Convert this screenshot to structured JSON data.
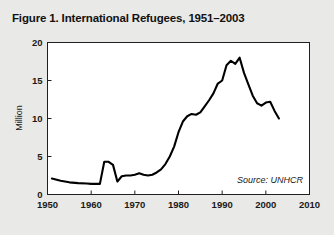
{
  "figure": {
    "title": "Figure 1. International Refugees, 1951–2003",
    "source_note": "Source: UNHCR",
    "background_color": "#e9e9e7",
    "plot_background_color": "#ffffff",
    "line_color": "#000000",
    "frame_color": "#231f20"
  },
  "chart_data": {
    "type": "line",
    "title": "Figure 1. International Refugees, 1951–2003",
    "xlabel": "",
    "ylabel": "Million",
    "xlim": [
      1950,
      2010
    ],
    "ylim": [
      0,
      20
    ],
    "xticks": [
      1950,
      1960,
      1970,
      1980,
      1990,
      2000,
      2010
    ],
    "yticks": [
      0,
      5,
      10,
      15,
      20
    ],
    "xtick_labels": [
      "1950",
      "1960",
      "1970",
      "1980",
      "1990",
      "2000",
      "2010"
    ],
    "ytick_labels": [
      "0",
      "5",
      "10",
      "15",
      "20"
    ],
    "grid": false,
    "legend": null,
    "annotations": [
      {
        "text": "Source: UNHCR",
        "position": "bottom-right",
        "style": "italic"
      }
    ],
    "series": [
      {
        "name": "International Refugees",
        "units": "Million",
        "x": [
          1951,
          1953,
          1955,
          1957,
          1959,
          1960,
          1961,
          1962,
          1963,
          1964,
          1965,
          1966,
          1967,
          1968,
          1969,
          1970,
          1971,
          1972,
          1973,
          1974,
          1975,
          1976,
          1977,
          1978,
          1979,
          1980,
          1981,
          1982,
          1983,
          1984,
          1985,
          1986,
          1987,
          1988,
          1989,
          1990,
          1991,
          1992,
          1993,
          1994,
          1995,
          1996,
          1997,
          1998,
          1999,
          2000,
          2001,
          2002,
          2003
        ],
        "values": [
          2.1,
          1.8,
          1.6,
          1.5,
          1.45,
          1.4,
          1.4,
          1.4,
          4.3,
          4.3,
          3.9,
          1.7,
          2.4,
          2.5,
          2.5,
          2.6,
          2.8,
          2.6,
          2.5,
          2.6,
          2.9,
          3.3,
          4.0,
          5.0,
          6.3,
          8.2,
          9.6,
          10.3,
          10.6,
          10.5,
          10.8,
          11.6,
          12.4,
          13.3,
          14.6,
          15.0,
          17.0,
          17.6,
          17.2,
          18.0,
          16.0,
          14.5,
          13.0,
          12.0,
          11.7,
          12.1,
          12.2,
          11.0,
          10.0
        ]
      }
    ]
  }
}
